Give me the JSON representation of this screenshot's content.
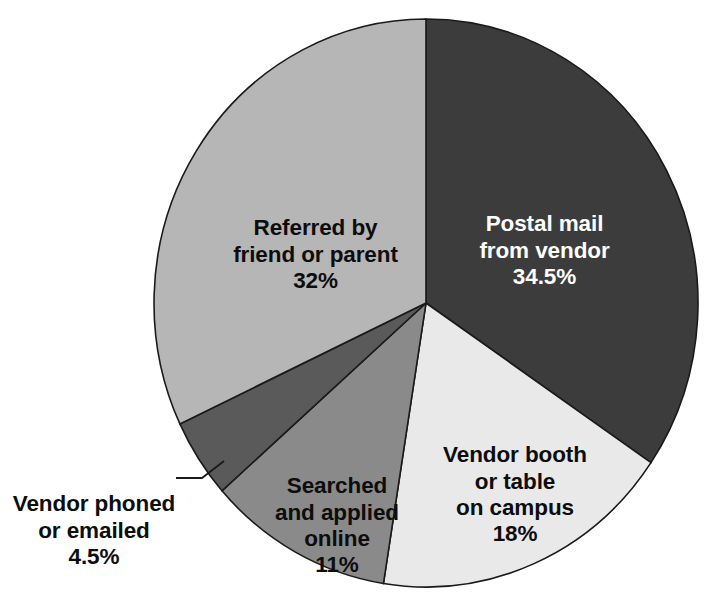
{
  "chart_data": {
    "type": "pie",
    "title": "",
    "subtitle": "",
    "xlabel": "",
    "ylabel": "",
    "legend_position": "none",
    "grid": false,
    "units": "percent",
    "total": 100,
    "start_angle_deg": 0,
    "direction": "clockwise",
    "categories": [
      "Postal mail from vendor",
      "Vendor booth or table on campus",
      "Searched and applied online",
      "Vendor phoned or emailed",
      "Referred by friend or parent"
    ],
    "values": [
      34.5,
      18,
      11,
      4.5,
      32
    ],
    "colors": [
      "#3c3c3c",
      "#e9e9e9",
      "#8a8a8a",
      "#5a5a5a",
      "#b6b6b6"
    ],
    "slices": [
      {
        "label": "Postal mail\nfrom vendor",
        "value_text": "34.5%",
        "value": 34.5,
        "color": "#3c3c3c",
        "label_placement": "inside",
        "text_color": "#ffffff"
      },
      {
        "label": "Vendor booth\nor table\non campus",
        "value_text": "18%",
        "value": 18,
        "color": "#e9e9e9",
        "label_placement": "inside",
        "text_color": "#0d0d0d"
      },
      {
        "label": "Searched\nand applied\nonline",
        "value_text": "11%",
        "value": 11,
        "color": "#8a8a8a",
        "label_placement": "inside",
        "text_color": "#0d0d0d"
      },
      {
        "label": "Vendor phoned\nor emailed",
        "value_text": "4.5%",
        "value": 4.5,
        "color": "#5a5a5a",
        "label_placement": "outside-leader",
        "text_color": "#0d0d0d"
      },
      {
        "label": "Referred by\nfriend or parent",
        "value_text": "32%",
        "value": 32,
        "color": "#b6b6b6",
        "label_placement": "inside",
        "text_color": "#0d0d0d"
      }
    ]
  },
  "geometry": {
    "center_x": 426,
    "center_y": 303,
    "radius_x": 272,
    "radius_y": 284,
    "outline_color": "#1a1a1a",
    "outline_width": 1.6
  },
  "background": "#ffffff"
}
